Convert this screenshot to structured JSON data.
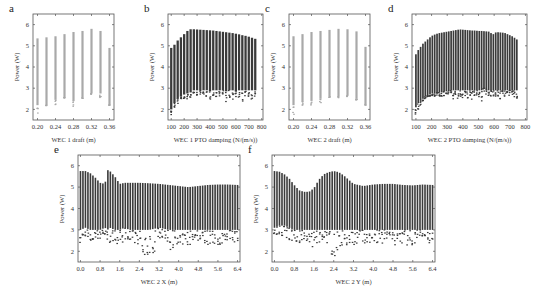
{
  "chart_data": [
    {
      "id": "a",
      "letter": "a",
      "type": "scatter",
      "xlabel": "WEC 1 draft (m)",
      "ylabel": "Power (W)",
      "xticks": [
        "0.20",
        "0.24",
        "0.28",
        "0.32",
        "0.36"
      ],
      "yticks": [
        "2",
        "3",
        "4",
        "5",
        "6"
      ],
      "xlim": [
        0.19,
        0.37
      ],
      "ylim": [
        1.5,
        6.5
      ],
      "style": "columns-light",
      "x": [
        0.2,
        0.22,
        0.24,
        0.26,
        0.28,
        0.3,
        0.32,
        0.34,
        0.36
      ],
      "top": [
        5.35,
        5.4,
        5.45,
        5.55,
        5.65,
        5.7,
        5.8,
        5.7,
        4.9
      ],
      "bottom": [
        2.2,
        2.2,
        2.45,
        2.55,
        2.4,
        2.55,
        2.75,
        2.75,
        2.2
      ],
      "min_outlier": [
        1.75,
        2.15,
        2.2,
        2.55,
        2.1,
        2.5,
        2.7,
        2.5,
        2.2
      ]
    },
    {
      "id": "b",
      "letter": "b",
      "type": "scatter",
      "xlabel": "WEC 1 PTO damping (N/(m/s))",
      "ylabel": "Power (W)",
      "xticks": [
        "100",
        "200",
        "300",
        "400",
        "500",
        "600",
        "700",
        "800"
      ],
      "yticks": [
        "2",
        "3",
        "4",
        "5",
        "6"
      ],
      "xlim": [
        75,
        810
      ],
      "ylim": [
        1.5,
        6.5
      ],
      "style": "columns-dark",
      "x": [
        100,
        125,
        150,
        175,
        200,
        225,
        250,
        275,
        300,
        325,
        350,
        375,
        400,
        425,
        450,
        475,
        500,
        525,
        550,
        575,
        600,
        625,
        650,
        675,
        700,
        725,
        750
      ],
      "top": [
        4.9,
        5.05,
        5.25,
        5.4,
        5.55,
        5.7,
        5.78,
        5.78,
        5.77,
        5.76,
        5.75,
        5.74,
        5.73,
        5.72,
        5.7,
        5.68,
        5.66,
        5.64,
        5.62,
        5.6,
        5.57,
        5.54,
        5.5,
        5.47,
        5.43,
        5.38,
        5.33
      ],
      "bottom": [
        2.0,
        2.3,
        2.5,
        2.6,
        2.7,
        2.75,
        2.8,
        2.9,
        2.9,
        2.9,
        2.9,
        2.9,
        2.85,
        2.9,
        2.9,
        2.9,
        2.9,
        2.85,
        2.9,
        2.9,
        2.85,
        2.9,
        2.9,
        2.9,
        2.9,
        2.9,
        2.9
      ],
      "min_outlier": [
        1.75,
        2.1,
        2.2,
        2.5,
        2.5,
        2.5,
        2.5,
        2.6,
        2.6,
        2.7,
        2.7,
        2.6,
        2.45,
        2.6,
        2.5,
        2.6,
        2.6,
        2.35,
        2.5,
        2.3,
        2.6,
        2.5,
        2.25,
        2.6,
        2.6,
        2.4,
        2.5
      ]
    },
    {
      "id": "c",
      "letter": "c",
      "type": "scatter",
      "xlabel": "WEC 2 draft (m)",
      "ylabel": "Power (W)",
      "xticks": [
        "0.20",
        "0.24",
        "0.28",
        "0.32",
        "0.36"
      ],
      "yticks": [
        "2",
        "3",
        "4",
        "5",
        "6"
      ],
      "xlim": [
        0.19,
        0.37
      ],
      "ylim": [
        1.5,
        6.5
      ],
      "style": "columns-light",
      "x": [
        0.2,
        0.22,
        0.24,
        0.26,
        0.28,
        0.3,
        0.32,
        0.34,
        0.36
      ],
      "top": [
        5.45,
        5.55,
        5.65,
        5.7,
        5.75,
        5.8,
        5.78,
        5.68,
        4.95
      ],
      "bottom": [
        2.2,
        2.35,
        2.4,
        2.5,
        2.6,
        2.6,
        2.65,
        2.5,
        2.25
      ],
      "min_outlier": [
        1.75,
        2.1,
        2.2,
        2.3,
        2.5,
        2.55,
        2.6,
        2.4,
        2.2
      ]
    },
    {
      "id": "d",
      "letter": "d",
      "type": "scatter",
      "xlabel": "WEC 2 PTO damping (N/(m/s))",
      "ylabel": "Power (W)",
      "xticks": [
        "100",
        "200",
        "300",
        "400",
        "500",
        "600",
        "700",
        "800"
      ],
      "yticks": [
        "2",
        "3",
        "4",
        "5",
        "6"
      ],
      "xlim": [
        75,
        810
      ],
      "ylim": [
        1.5,
        6.5
      ],
      "style": "columns-dark",
      "x": [
        100,
        115,
        130,
        145,
        160,
        175,
        190,
        205,
        220,
        235,
        250,
        265,
        280,
        295,
        310,
        325,
        340,
        355,
        370,
        385,
        400,
        415,
        430,
        445,
        460,
        475,
        490,
        505,
        520,
        535,
        550,
        565,
        580,
        595,
        610,
        625,
        640,
        655,
        670,
        685,
        700,
        715,
        730,
        745
      ],
      "top": [
        4.6,
        4.8,
        4.95,
        5.1,
        5.2,
        5.3,
        5.4,
        5.48,
        5.53,
        5.57,
        5.6,
        5.62,
        5.64,
        5.66,
        5.68,
        5.7,
        5.72,
        5.74,
        5.76,
        5.77,
        5.76,
        5.75,
        5.74,
        5.73,
        5.72,
        5.72,
        5.71,
        5.7,
        5.7,
        5.69,
        5.68,
        5.67,
        5.6,
        5.55,
        5.63,
        5.64,
        5.63,
        5.62,
        5.6,
        5.55,
        5.5,
        5.45,
        5.38,
        5.3
      ],
      "bottom": [
        2.1,
        2.3,
        2.4,
        2.5,
        2.6,
        2.65,
        2.7,
        2.75,
        2.75,
        2.8,
        2.8,
        2.8,
        2.85,
        2.85,
        2.9,
        2.9,
        2.9,
        2.9,
        2.9,
        2.9,
        2.9,
        2.9,
        2.9,
        2.9,
        2.9,
        2.9,
        2.9,
        2.9,
        2.9,
        3.0,
        2.95,
        2.9,
        2.9,
        2.9,
        2.9,
        2.9,
        2.9,
        2.9,
        2.9,
        2.9,
        2.9,
        2.9,
        2.9,
        2.9
      ],
      "min_outlier": [
        1.75,
        2.0,
        2.2,
        2.4,
        2.5,
        2.6,
        2.6,
        2.6,
        2.6,
        2.6,
        2.6,
        2.6,
        2.6,
        2.5,
        2.6,
        2.7,
        2.5,
        2.6,
        2.5,
        2.6,
        2.4,
        2.6,
        2.5,
        2.6,
        2.4,
        2.6,
        2.6,
        2.6,
        2.3,
        2.6,
        2.6,
        2.6,
        2.4,
        2.6,
        2.6,
        2.6,
        2.3,
        2.6,
        2.6,
        2.6,
        2.6,
        2.5,
        2.6,
        2.5
      ]
    },
    {
      "id": "e",
      "letter": "e",
      "type": "scatter",
      "xlabel": "WEC 2 X (m)",
      "ylabel": "Power (W)",
      "xticks": [
        "0.0",
        "0.8",
        "1.6",
        "2.4",
        "3.2",
        "4.0",
        "4.8",
        "5.6",
        "6.4"
      ],
      "yticks": [
        "2",
        "3",
        "4",
        "5",
        "6"
      ],
      "xlim": [
        -0.1,
        6.5
      ],
      "ylim": [
        1.5,
        6.5
      ],
      "style": "dense-dark",
      "x": [
        0.0,
        0.2,
        0.4,
        0.6,
        0.8,
        1.0,
        1.1,
        1.2,
        1.4,
        1.6,
        1.8,
        2.0,
        2.4,
        2.8,
        3.2,
        3.6,
        4.0,
        4.4,
        4.8,
        5.2,
        5.6,
        6.0,
        6.4
      ],
      "top": [
        5.75,
        5.75,
        5.65,
        5.45,
        5.2,
        5.15,
        5.8,
        5.75,
        5.5,
        5.15,
        5.2,
        5.2,
        5.2,
        5.18,
        5.15,
        5.1,
        5.05,
        5.0,
        5.05,
        5.1,
        5.12,
        5.12,
        5.1
      ],
      "bottom": [
        3.0,
        3.1,
        3.0,
        3.0,
        3.0,
        3.1,
        3.0,
        3.1,
        3.0,
        3.0,
        3.1,
        3.0,
        3.0,
        3.0,
        3.1,
        3.0,
        3.0,
        3.0,
        3.0,
        3.0,
        3.0,
        3.0,
        3.0
      ],
      "min_outlier": [
        2.4,
        2.6,
        2.5,
        2.6,
        2.6,
        2.5,
        2.6,
        2.4,
        2.5,
        2.2,
        2.4,
        2.5,
        2.1,
        1.65,
        2.2,
        2.0,
        2.3,
        2.3,
        2.4,
        2.3,
        2.3,
        2.4,
        2.3
      ]
    },
    {
      "id": "f",
      "letter": "f",
      "type": "scatter",
      "xlabel": "WEC 2 Y (m)",
      "ylabel": "Power (W)",
      "xticks": [
        "0.0",
        "0.8",
        "1.6",
        "2.4",
        "3.2",
        "4.0",
        "4.8",
        "5.6",
        "6.4"
      ],
      "yticks": [
        "2",
        "3",
        "4",
        "5",
        "6"
      ],
      "xlim": [
        -0.1,
        6.5
      ],
      "ylim": [
        1.5,
        6.5
      ],
      "style": "dense-dark",
      "x": [
        0.0,
        0.2,
        0.4,
        0.6,
        0.8,
        1.0,
        1.2,
        1.4,
        1.6,
        1.8,
        2.0,
        2.2,
        2.4,
        2.6,
        2.8,
        3.0,
        3.2,
        3.6,
        4.0,
        4.4,
        4.8,
        5.2,
        5.6,
        6.0,
        6.4
      ],
      "top": [
        5.75,
        5.72,
        5.6,
        5.4,
        5.1,
        4.85,
        4.78,
        4.78,
        4.95,
        5.35,
        5.6,
        5.7,
        5.75,
        5.7,
        5.55,
        5.35,
        5.15,
        5.05,
        5.12,
        5.15,
        5.15,
        5.1,
        5.08,
        5.12,
        5.1
      ],
      "bottom": [
        3.1,
        3.2,
        3.2,
        3.1,
        3.0,
        3.0,
        3.0,
        3.0,
        3.0,
        3.0,
        3.0,
        3.0,
        3.0,
        3.0,
        3.0,
        3.0,
        3.0,
        3.0,
        3.0,
        3.0,
        3.0,
        3.0,
        3.0,
        3.0,
        3.0
      ],
      "min_outlier": [
        2.5,
        2.6,
        2.7,
        2.5,
        2.5,
        2.4,
        2.4,
        2.4,
        2.0,
        2.3,
        2.4,
        2.2,
        1.65,
        2.2,
        2.3,
        2.3,
        2.2,
        2.3,
        2.4,
        2.3,
        2.2,
        2.2,
        2.3,
        2.4,
        2.4
      ]
    }
  ],
  "layout": {
    "panels": {
      "a": {
        "left": 33,
        "top": 14,
        "width": 81,
        "height": 106
      },
      "b": {
        "left": 168,
        "top": 14,
        "width": 95,
        "height": 106
      },
      "c": {
        "left": 289,
        "top": 14,
        "width": 81,
        "height": 106
      },
      "d": {
        "left": 412,
        "top": 14,
        "width": 115,
        "height": 106
      },
      "e": {
        "left": 78,
        "top": 155,
        "width": 162,
        "height": 107
      },
      "f": {
        "left": 272,
        "top": 155,
        "width": 163,
        "height": 107
      }
    },
    "colors": {
      "light": "#a9a9a9",
      "dark": "#3a3a3a",
      "axis": "#555555"
    }
  }
}
